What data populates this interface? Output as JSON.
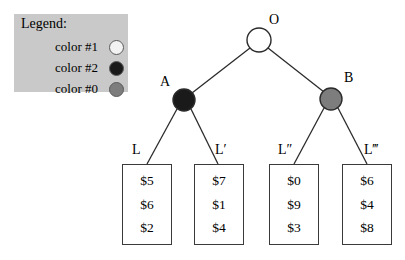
{
  "legend": {
    "title": "Legend:",
    "items": [
      {
        "label": "color #1",
        "swatch_name": "legend-swatch-white",
        "color": "#f2f2f2"
      },
      {
        "label": "color #2",
        "swatch_name": "legend-swatch-black",
        "color": "#1a1a1a"
      },
      {
        "label": "color #0",
        "swatch_name": "legend-swatch-gray",
        "color": "#7d7d7d"
      }
    ],
    "background": "#c9c9c9"
  },
  "tree": {
    "nodes": [
      {
        "id": "root",
        "label": "O",
        "color": "#ffffff",
        "cx": 259,
        "cy": 40,
        "r": 12
      },
      {
        "id": "left",
        "label": "A",
        "color": "#1a1a1a",
        "cx": 184,
        "cy": 100,
        "r": 11
      },
      {
        "id": "right",
        "label": "B",
        "color": "#7d7d7d",
        "cx": 331,
        "cy": 99,
        "r": 11
      }
    ],
    "leaves": [
      {
        "label": "L",
        "values": [
          "$5",
          "$6",
          "$2"
        ]
      },
      {
        "label": "L′",
        "values": [
          "$7",
          "$1",
          "$4"
        ]
      },
      {
        "label": "L″",
        "values": [
          "$0",
          "$9",
          "$3"
        ]
      },
      {
        "label": "L‴",
        "values": [
          "$6",
          "$4",
          "$8"
        ]
      }
    ]
  },
  "colors": {
    "line": "#2b2b2b",
    "box_border": "#3a3a3a",
    "background": "#ffffff"
  }
}
